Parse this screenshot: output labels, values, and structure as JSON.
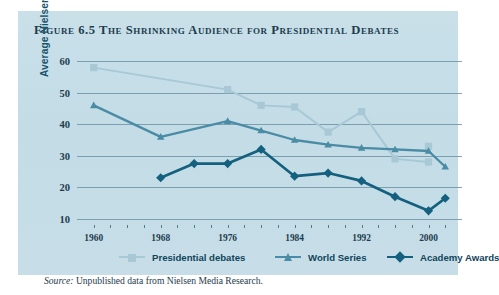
{
  "figure": {
    "title": "Figure 6.5 The Shrinking Audience for Presidential Debates",
    "source_label": "Source:",
    "source_text": " Unpublished data from Nielsen Media Research.",
    "panel_bg": "#c5dde7",
    "page_bg": "#ffffff"
  },
  "chart_data": {
    "type": "line",
    "title": "Figure 6.5 The Shrinking Audience for Presidential Debates",
    "xlabel": "",
    "ylabel": "Average Nielsen rating",
    "xlim": [
      1958,
      2004
    ],
    "ylim": [
      8,
      62
    ],
    "yticks": [
      10,
      20,
      30,
      40,
      50,
      60
    ],
    "xticks": [
      1960,
      1968,
      1976,
      1984,
      1992,
      2000
    ],
    "xtick_labels": [
      "1960",
      "1968",
      "1976",
      "1984",
      "1992",
      "2000"
    ],
    "ytick_labels": [
      "10",
      "20",
      "30",
      "40",
      "50",
      "60"
    ],
    "grid": true,
    "grid_axis": "y",
    "legend_position": "bottom",
    "series": [
      {
        "name": "Presidential debates",
        "color": "#a8c8d6",
        "marker": "square",
        "x": [
          1960,
          1976,
          1980,
          1984,
          1988,
          1992,
          1996,
          2000
        ],
        "values": [
          58,
          51,
          46,
          45.5,
          37.5,
          44,
          29,
          28
        ]
      },
      {
        "name": "World Series",
        "color": "#4a8ba5",
        "marker": "triangle",
        "x": [
          1960,
          1968,
          1976,
          1980,
          1984,
          1988,
          1992,
          1996,
          2000,
          2002
        ],
        "values": [
          46,
          36,
          41,
          38,
          35,
          33.5,
          32.5,
          32,
          31.5,
          26.5
        ]
      },
      {
        "name": "Academy Awards",
        "color": "#14607f",
        "marker": "diamond",
        "x": [
          1968,
          1972,
          1976,
          1980,
          1984,
          1988,
          1992,
          1996,
          2000,
          2002
        ],
        "values": [
          23,
          27.5,
          27.5,
          32,
          23.5,
          24.5,
          22,
          17,
          12.5,
          16.5
        ]
      }
    ],
    "extra_points": {
      "Presidential debates": [
        {
          "x": 2000,
          "y": 33
        }
      ]
    }
  },
  "legend": {
    "items": [
      {
        "label": "Presidential debates",
        "marker": "square",
        "color": "#a8c8d6"
      },
      {
        "label": "World Series",
        "marker": "triangle",
        "color": "#4a8ba5"
      },
      {
        "label": "Academy Awards",
        "marker": "diamond",
        "color": "#14607f"
      }
    ]
  }
}
